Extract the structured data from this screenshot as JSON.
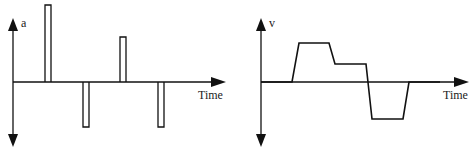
{
  "diagrams": [
    {
      "id": "acceleration",
      "y_axis_label": "a",
      "x_axis_label": "Time",
      "pulses": [
        {
          "x0": 45,
          "x1": 51,
          "top": 5,
          "sign": "positive"
        },
        {
          "x0": 83,
          "x1": 89,
          "bottom": 127,
          "sign": "negative"
        },
        {
          "x0": 120,
          "x1": 126,
          "top": 37,
          "sign": "positive"
        },
        {
          "x0": 158,
          "x1": 164,
          "bottom": 127,
          "sign": "negative"
        }
      ]
    },
    {
      "id": "velocity",
      "y_axis_label": "v",
      "x_axis_label": "Time",
      "path_description": "zero, ramp up to high plateau, step down to lower positive plateau, drop to negative plateau, ramp back to zero"
    }
  ],
  "colors": {
    "line": "#111111",
    "background": "#ffffff"
  }
}
